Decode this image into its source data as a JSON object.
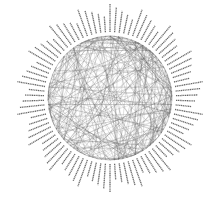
{
  "diagram": {
    "type": "circular-network-graph",
    "layout": "circular",
    "center": [
      110,
      98
    ],
    "node_radius": 62,
    "label_inner_radius": 66,
    "label_outer_radius": 94,
    "node_count": 90,
    "labels_legible": false,
    "label_note": "Node labels are radial text strings too small to read at this resolution",
    "edge_color": "#555555",
    "label_color": "#444444",
    "background": "#ffffff",
    "edge_density": "dense",
    "edge_seed": 7,
    "edge_count": 260
  }
}
